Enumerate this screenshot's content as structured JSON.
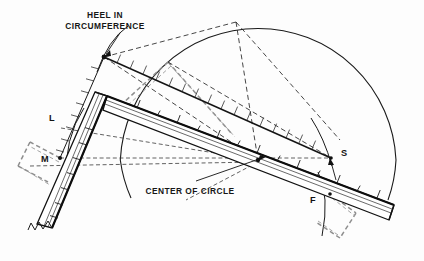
{
  "figure": {
    "background_color": "#fdfdfd",
    "ink_color": "#1a1a1a",
    "ghost_color": "#9a9a9a"
  },
  "captions": [
    {
      "id": "heel-in-circumference",
      "line1": "HEEL IN",
      "line2": "CIRCUMFERENCE",
      "x": 105,
      "y": 18,
      "leader_from_x": 120,
      "leader_from_y": 33,
      "leader_to_x": 104,
      "leader_to_y": 57
    },
    {
      "id": "center-of-circle",
      "line1": "CENTER OF CIRCLE",
      "line2": "",
      "x": 190,
      "y": 192,
      "leader_from_x": 190,
      "leader_from_y": 182,
      "leader_to_x": 172,
      "leader_to_y": 167
    }
  ],
  "point_labels": [
    {
      "name": "L",
      "text": "L",
      "x": 49,
      "y": 121
    },
    {
      "name": "M",
      "text": "M",
      "x": 41,
      "y": 162
    },
    {
      "name": "S",
      "text": "S",
      "x": 341,
      "y": 156
    },
    {
      "name": "F",
      "text": "F",
      "x": 310,
      "y": 203
    }
  ],
  "geometry": {
    "circle": {
      "center_x": 258,
      "center_y": 160,
      "radius": 138,
      "arc_start_deg": 182,
      "arc_end_deg": 360
    },
    "key_points": {
      "heel_in_circumference": {
        "x": 104,
        "y": 57
      },
      "center_of_circle": {
        "x": 258,
        "y": 160
      },
      "square_heel": {
        "x": 107,
        "y": 96
      },
      "point_L": {
        "x": 61,
        "y": 128
      },
      "point_M": {
        "x": 60,
        "y": 158
      },
      "point_S": {
        "x": 331,
        "y": 158
      },
      "point_F": {
        "x": 330,
        "y": 194
      },
      "blade_far_end": {
        "x": 394,
        "y": 214
      },
      "tongue_far_end": {
        "x": 52,
        "y": 232
      },
      "apex_top": {
        "x": 236,
        "y": 22
      }
    },
    "scale_ticks": {
      "blade_tick_count": 15,
      "tongue_tick_count": 8,
      "upper_rule_tick_count": 17
    }
  },
  "legend_notes": {
    "solid_lines": "solid square outline and circle arc",
    "dashed_dark_lines": "construction / chord lines",
    "dashed_gray_lines": "ghost positions of the stepped-off square"
  }
}
